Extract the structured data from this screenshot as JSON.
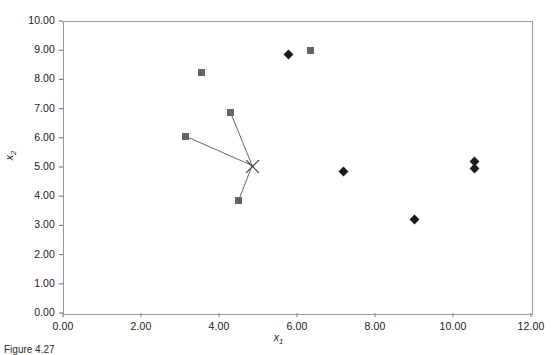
{
  "figure": {
    "caption": "Figure 4.27",
    "background": "#ffffff",
    "frame_color": "#9a9a9a"
  },
  "chart_data": {
    "type": "scatter",
    "title": "",
    "xlabel": "x1",
    "ylabel": "x2",
    "xlim": [
      0,
      12
    ],
    "ylim": [
      0,
      10
    ],
    "xticks": [
      "0.00",
      "2.00",
      "4.00",
      "6.00",
      "8.00",
      "10.00",
      "12.00"
    ],
    "xtick_values": [
      0,
      2,
      4,
      6,
      8,
      10,
      12
    ],
    "yticks": [
      "0.00",
      "1.00",
      "2.00",
      "3.00",
      "4.00",
      "5.00",
      "6.00",
      "7.00",
      "8.00",
      "9.00",
      "10.00"
    ],
    "ytick_values": [
      0,
      1,
      2,
      3,
      4,
      5,
      6,
      7,
      8,
      9,
      10
    ],
    "grid": false,
    "legend": false,
    "series": [
      {
        "name": "cluster-members",
        "marker": "square",
        "color": "#666666",
        "size": 7,
        "points": [
          {
            "x": 3.55,
            "y": 8.25
          },
          {
            "x": 6.35,
            "y": 9.0
          },
          {
            "x": 4.3,
            "y": 6.85
          },
          {
            "x": 3.15,
            "y": 6.05
          },
          {
            "x": 4.5,
            "y": 3.85
          }
        ]
      },
      {
        "name": "other-points",
        "marker": "diamond",
        "color": "#1a1a1a",
        "size": 7,
        "points": [
          {
            "x": 5.78,
            "y": 8.85
          },
          {
            "x": 7.18,
            "y": 4.85
          },
          {
            "x": 9.0,
            "y": 3.2
          },
          {
            "x": 10.55,
            "y": 5.2
          },
          {
            "x": 10.55,
            "y": 4.95
          }
        ]
      },
      {
        "name": "centroid",
        "marker": "cross-x",
        "color": "#333333",
        "size": 13,
        "points": [
          {
            "x": 4.85,
            "y": 5.05
          }
        ]
      }
    ],
    "connectors": {
      "name": "centroid-links",
      "color": "#555555",
      "from": {
        "x": 4.85,
        "y": 5.05
      },
      "to": [
        {
          "x": 4.3,
          "y": 6.85
        },
        {
          "x": 3.15,
          "y": 6.05
        },
        {
          "x": 4.5,
          "y": 3.85
        }
      ]
    }
  }
}
